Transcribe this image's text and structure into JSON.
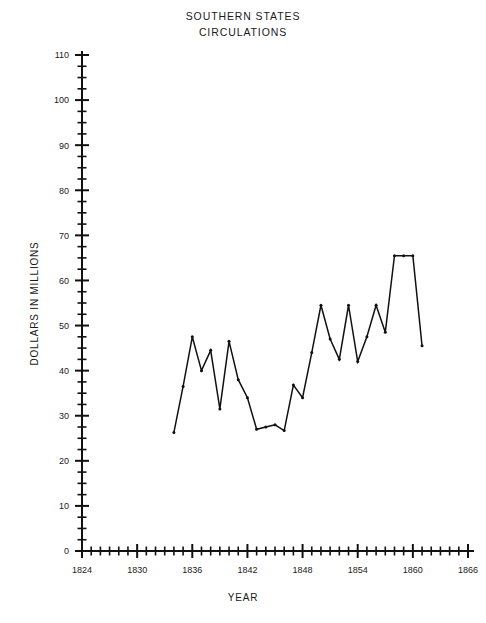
{
  "chart_data": {
    "type": "line",
    "title": "SOUTHERN STATES CIRCULATIONS",
    "title_lines": [
      "SOUTHERN  STATES",
      "CIRCULATIONS"
    ],
    "xlabel": "YEAR",
    "ylabel": "DOLLARS IN MILLIONS",
    "xlim": [
      1824,
      1866
    ],
    "ylim": [
      0,
      110
    ],
    "grid": false,
    "legend": null,
    "x_major_ticks": [
      1824,
      1830,
      1836,
      1842,
      1848,
      1854,
      1860,
      1866
    ],
    "x_tick_labels": [
      "1824",
      "1830",
      "1836",
      "1842",
      "1848",
      "1854",
      "1860",
      "1866"
    ],
    "x_minor_tick_step": 1,
    "y_major_ticks": [
      0,
      10,
      20,
      30,
      40,
      50,
      60,
      70,
      80,
      90,
      100,
      110
    ],
    "y_tick_labels": [
      "0",
      "10",
      "20",
      "30",
      "40",
      "50",
      "60",
      "70",
      "80",
      "90",
      "100",
      "110"
    ],
    "y_minor_tick_step": 2.5,
    "series": [
      {
        "name": "Southern states circulation",
        "x": [
          1834,
          1835,
          1836,
          1837,
          1838,
          1839,
          1840,
          1841,
          1842,
          1843,
          1844,
          1845,
          1846,
          1847,
          1848,
          1849,
          1850,
          1851,
          1852,
          1853,
          1854,
          1855,
          1856,
          1857,
          1858,
          1859,
          1860,
          1861
        ],
        "values": [
          26.3,
          36.5,
          47.5,
          40.0,
          44.5,
          31.5,
          46.5,
          38.0,
          34.0,
          27.0,
          27.5,
          28.0,
          26.7,
          36.8,
          34.0,
          44.0,
          54.5,
          47.0,
          42.5,
          54.5,
          42.0,
          47.5,
          54.5,
          48.5,
          65.5,
          65.5,
          65.5,
          45.5
        ]
      }
    ]
  },
  "plot_geometry": {
    "x0_px": 82,
    "y0_px": 551,
    "x_max_px": 468,
    "y_top_px": 55
  }
}
